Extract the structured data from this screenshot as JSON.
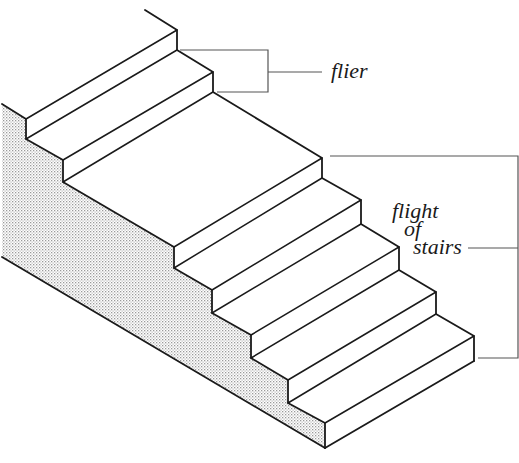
{
  "figure": {
    "type": "isometric staircase diagram",
    "colors": {
      "background": "#ffffff",
      "ink": "#1a1a1a",
      "leader": "#555555",
      "stipple_dot": "#9a9a9a"
    }
  },
  "labels": {
    "flier": "flier",
    "flight_line1": "flight",
    "flight_line2": "of",
    "flight_line3": "stairs"
  },
  "annotations": [
    {
      "id": "flier",
      "text": "flier",
      "points_to": "single step (tread + riser)"
    },
    {
      "id": "flight-of-stairs",
      "text": "flight of stairs",
      "points_to": "lower series of steps"
    }
  ]
}
